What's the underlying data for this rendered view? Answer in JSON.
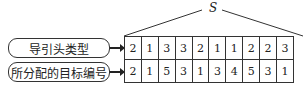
{
  "diagram": {
    "span_label": "S",
    "rows": [
      {
        "label": "导引头类型",
        "values": [
          "2",
          "1",
          "3",
          "3",
          "2",
          "1",
          "1",
          "2",
          "2",
          "3"
        ]
      },
      {
        "label": "所分配的目标编号",
        "values": [
          "2",
          "1",
          "5",
          "3",
          "1",
          "3",
          "4",
          "5",
          "3",
          "1"
        ]
      }
    ]
  }
}
